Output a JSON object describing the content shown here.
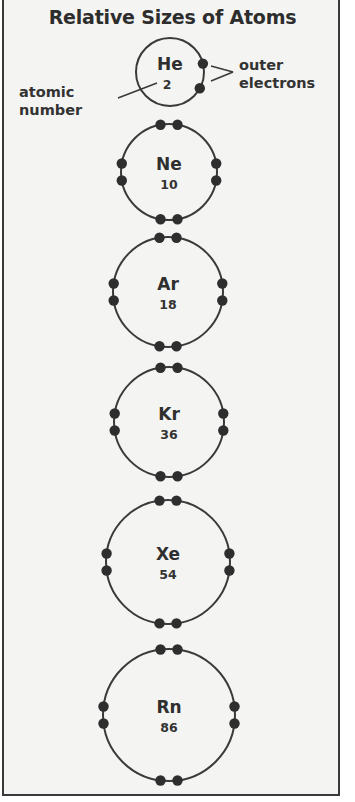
{
  "title": "Relative Sizes of Atoms",
  "annotations": {
    "atomic_number": "atomic\nnumber",
    "atomic_number_line1": "atomic",
    "atomic_number_line2": "number",
    "outer_electrons_line1": "outer",
    "outer_electrons_line2": "electrons"
  },
  "atoms": [
    {
      "symbol": "He",
      "atomic_number": "2",
      "outer_electrons": 2,
      "cx": 170,
      "cy": 72,
      "r": 34
    },
    {
      "symbol": "Ne",
      "atomic_number": "10",
      "outer_electrons": 8,
      "cx": 169,
      "cy": 172,
      "r": 48
    },
    {
      "symbol": "Ar",
      "atomic_number": "18",
      "outer_electrons": 8,
      "cx": 168,
      "cy": 292,
      "r": 55
    },
    {
      "symbol": "Kr",
      "atomic_number": "36",
      "outer_electrons": 8,
      "cx": 169,
      "cy": 422,
      "r": 55
    },
    {
      "symbol": "Xe",
      "atomic_number": "54",
      "outer_electrons": 8,
      "cx": 168,
      "cy": 562,
      "r": 62
    },
    {
      "symbol": "Rn",
      "atomic_number": "86",
      "outer_electrons": 8,
      "cx": 169,
      "cy": 715,
      "r": 66
    }
  ],
  "colors": {
    "line": "#3a3a3a",
    "electron": "#2e2e2e",
    "background": "#f4f4f2"
  }
}
